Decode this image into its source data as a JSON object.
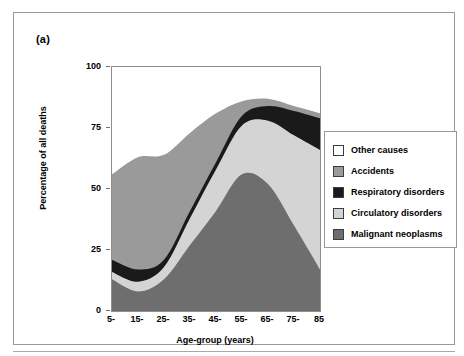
{
  "figure": {
    "panel_label": "(a)"
  },
  "legend": {
    "items": [
      {
        "label": "Other causes",
        "color": "#ffffff"
      },
      {
        "label": "Accidents",
        "color": "#9a9a9a"
      },
      {
        "label": "Respiratory disorders",
        "color": "#1a1a1a"
      },
      {
        "label": "Circulatory disorders",
        "color": "#d4d4d4"
      },
      {
        "label": "Malignant neoplasms",
        "color": "#6e6e6e"
      }
    ]
  },
  "chart_data": {
    "type": "area",
    "stacked": true,
    "title": "",
    "xlabel": "Age-group (years)",
    "ylabel": "Percentage of all deaths",
    "categories": [
      "5-",
      "15-",
      "25-",
      "35-",
      "45-",
      "55-",
      "65-",
      "75-",
      "85"
    ],
    "x": [
      5,
      15,
      25,
      35,
      45,
      55,
      65,
      75,
      85
    ],
    "xlim": [
      5,
      85
    ],
    "ylim": [
      0,
      100
    ],
    "yticks": [
      0,
      25,
      50,
      75,
      100
    ],
    "xticks": [
      "5-",
      "15-",
      "25-",
      "35-",
      "45-",
      "55-",
      "65-",
      "75-",
      "85"
    ],
    "grid": false,
    "legend_position": "right",
    "series": [
      {
        "name": "Malignant neoplasms",
        "color": "#6e6e6e",
        "values": [
          13,
          8,
          13,
          27,
          41,
          56,
          52,
          35,
          17
        ]
      },
      {
        "name": "Circulatory disorders",
        "color": "#d4d4d4",
        "values": [
          3,
          4,
          5,
          11,
          17,
          20,
          26,
          37,
          49
        ]
      },
      {
        "name": "Respiratory disorders",
        "color": "#1a1a1a",
        "values": [
          5,
          5,
          3,
          3,
          3,
          4,
          6,
          10,
          13
        ]
      },
      {
        "name": "Accidents",
        "color": "#9a9a9a",
        "values": [
          35,
          46,
          43,
          32,
          20,
          6,
          3,
          2,
          2
        ]
      },
      {
        "name": "Other causes",
        "color": "#ffffff",
        "values": [
          44,
          37,
          36,
          27,
          19,
          14,
          13,
          16,
          19
        ]
      }
    ],
    "cumulative_tops": {
      "Malignant neoplasms": [
        13,
        8,
        13,
        27,
        41,
        56,
        52,
        35,
        17
      ],
      "Circulatory disorders": [
        16,
        12,
        18,
        38,
        58,
        76,
        78,
        72,
        66
      ],
      "Respiratory disorders": [
        21,
        17,
        21,
        41,
        61,
        80,
        84,
        82,
        79
      ],
      "Accidents": [
        56,
        63,
        64,
        73,
        81,
        86,
        87,
        84,
        81
      ],
      "Other causes": [
        100,
        100,
        100,
        100,
        100,
        100,
        100,
        100,
        100
      ]
    }
  }
}
